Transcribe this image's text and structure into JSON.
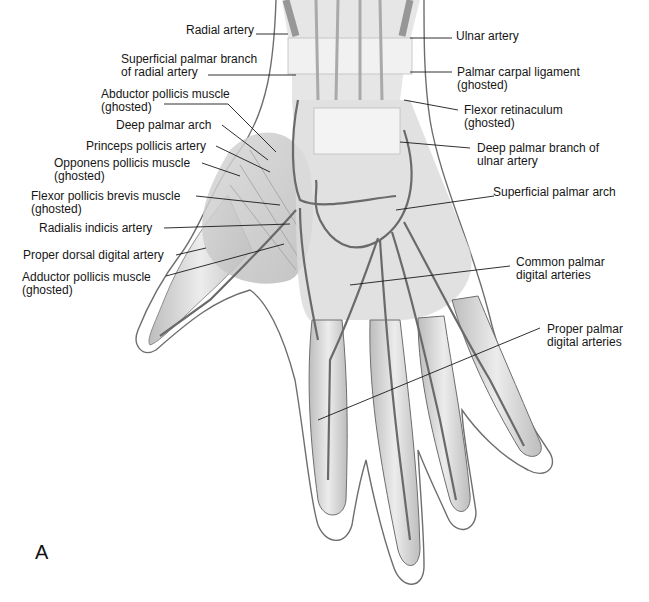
{
  "figure": {
    "panel_letter": "A",
    "labels_left": [
      {
        "id": "radial-artery",
        "lines": [
          "Radial artery"
        ]
      },
      {
        "id": "superficial-palmar-branch-radial",
        "lines": [
          "Superficial palmar branch",
          "of radial artery"
        ]
      },
      {
        "id": "abductor-pollicis-muscle",
        "lines": [
          "Abductor pollicis muscle",
          "(ghosted)"
        ]
      },
      {
        "id": "deep-palmar-arch",
        "lines": [
          "Deep palmar arch"
        ]
      },
      {
        "id": "princeps-pollicis-artery",
        "lines": [
          "Princeps pollicis artery"
        ]
      },
      {
        "id": "opponens-pollicis-muscle",
        "lines": [
          "Opponens pollicis muscle",
          "(ghosted)"
        ]
      },
      {
        "id": "flexor-pollicis-brevis-muscle",
        "lines": [
          "Flexor pollicis brevis muscle",
          "(ghosted)"
        ]
      },
      {
        "id": "radialis-indicis-artery",
        "lines": [
          "Radialis indicis artery"
        ]
      },
      {
        "id": "proper-dorsal-digital-artery",
        "lines": [
          "Proper dorsal digital artery"
        ]
      },
      {
        "id": "adductor-pollicis-muscle",
        "lines": [
          "Adductor pollicis muscle",
          "(ghosted)"
        ]
      }
    ],
    "labels_right": [
      {
        "id": "ulnar-artery",
        "lines": [
          "Ulnar artery"
        ]
      },
      {
        "id": "palmar-carpal-ligament",
        "lines": [
          "Palmar carpal ligament",
          "(ghosted)"
        ]
      },
      {
        "id": "flexor-retinaculum",
        "lines": [
          "Flexor retinaculum",
          "(ghosted)"
        ]
      },
      {
        "id": "deep-palmar-branch-ulnar",
        "lines": [
          "Deep palmar branch of",
          "ulnar artery"
        ]
      },
      {
        "id": "superficial-palmar-arch",
        "lines": [
          "Superficial palmar arch"
        ]
      },
      {
        "id": "common-palmar-digital-arteries",
        "lines": [
          "Common palmar",
          "digital arteries"
        ]
      },
      {
        "id": "proper-palmar-digital-arteries",
        "lines": [
          "Proper palmar",
          "digital arteries"
        ]
      }
    ],
    "colors": {
      "outline": "#6e6e6e",
      "tissue": "#c9c9c9",
      "artery": "#6a6a6a",
      "leader": "#1a1a1a"
    }
  }
}
